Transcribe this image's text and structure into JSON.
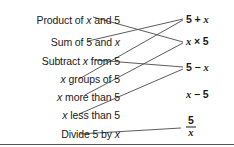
{
  "diagram": {
    "type": "matching-activity",
    "title_text": "",
    "line_color": "#4a4a4a",
    "text_color": "#1a1a1a",
    "rule_color": "#555555",
    "left_column": [
      {
        "id": "l1",
        "label": "Product of x and 5",
        "pre": "Product of ",
        "var": "x",
        "post": " and 5",
        "y": 20
      },
      {
        "id": "l2",
        "label": "Sum of 5 and x",
        "pre": "Sum of 5 and ",
        "var": "x",
        "post": "",
        "y": 42
      },
      {
        "id": "l3",
        "label": "Subtract x from 5",
        "pre": "Subtract ",
        "var": "x",
        "post": " from 5",
        "y": 61
      },
      {
        "id": "l4",
        "label": "x groups of 5",
        "pre": "",
        "var": "x",
        "post": " groups of 5",
        "y": 79
      },
      {
        "id": "l5",
        "label": "x more than 5",
        "pre": "",
        "var": "x",
        "post": " more than 5",
        "y": 97
      },
      {
        "id": "l6",
        "label": "x less than 5",
        "pre": "",
        "var": "x",
        "post": " less than 5",
        "y": 115
      },
      {
        "id": "l7",
        "label": "Divide 5 by x",
        "pre": "Divide 5 by ",
        "var": "x",
        "post": "",
        "y": 134
      }
    ],
    "right_column": [
      {
        "id": "r1",
        "label": "5 + x",
        "pre": "5 + ",
        "var": "x",
        "post": "",
        "y": 20,
        "fraction": false
      },
      {
        "id": "r2",
        "label": "x × 5",
        "pre": "",
        "var": "x",
        "post": " × 5",
        "y": 42,
        "fraction": false
      },
      {
        "id": "r3",
        "label": "5 − x",
        "pre": "5 − ",
        "var": "x",
        "post": "",
        "y": 68,
        "fraction": false
      },
      {
        "id": "r4",
        "label": "x − 5",
        "pre": "",
        "var": "x",
        "post": " − 5",
        "y": 95,
        "fraction": false
      },
      {
        "id": "r5",
        "label": "5 over x",
        "numerator": "5",
        "denominator": "x",
        "y": 127,
        "fraction": true
      }
    ],
    "connections": [
      {
        "from": "l1",
        "to": "r2",
        "x1": 93,
        "y1": 17,
        "x2": 183,
        "y2": 42
      },
      {
        "from": "l2",
        "to": "r1",
        "x1": 88,
        "y1": 41,
        "x2": 183,
        "y2": 19
      },
      {
        "from": "l3",
        "to": "r3",
        "x1": 95,
        "y1": 60,
        "x2": 183,
        "y2": 67
      },
      {
        "from": "l4",
        "to": "r1",
        "x1": 79,
        "y1": 79,
        "x2": 183,
        "y2": 20
      },
      {
        "from": "l5",
        "to": "r2",
        "x1": 85,
        "y1": 95,
        "x2": 183,
        "y2": 43
      },
      {
        "from": "l6",
        "to": "r3",
        "x1": 79,
        "y1": 114,
        "x2": 183,
        "y2": 69
      },
      {
        "from": "l7",
        "to": "r5",
        "x1": 79,
        "y1": 134,
        "x2": 181,
        "y2": 128
      }
    ],
    "rules": [
      {
        "id": "bottom-rule",
        "y": 144
      }
    ]
  }
}
